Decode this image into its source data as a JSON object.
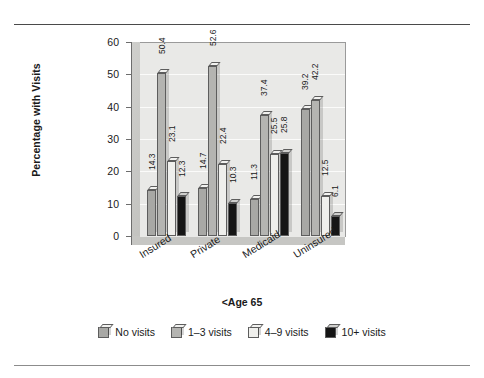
{
  "chart_data": {
    "type": "bar",
    "title": "",
    "xlabel": "<Age 65",
    "ylabel": "Percentage with Visits",
    "ylim": [
      0,
      60
    ],
    "yticks": [
      0,
      10,
      20,
      30,
      40,
      50,
      60
    ],
    "grid": true,
    "legend_position": "bottom",
    "categories": [
      "Insured",
      "Private",
      "Medicaid",
      "Uninsured"
    ],
    "series": [
      {
        "name": "No visits",
        "color": "#a8a8a5",
        "values": [
          14.3,
          14.7,
          11.3,
          39.2
        ]
      },
      {
        "name": "1–3 visits",
        "color": "#b4b4b1",
        "values": [
          50.4,
          52.6,
          37.4,
          42.2
        ]
      },
      {
        "name": "4–9 visits",
        "color": "#efefec",
        "values": [
          23.1,
          22.4,
          25.5,
          12.5
        ]
      },
      {
        "name": "10+ visits",
        "color": "#151515",
        "values": [
          12.3,
          10.3,
          25.8,
          6.1
        ]
      }
    ],
    "value_labels": [
      [
        "14.3",
        "50.4",
        "23.1",
        "12.3"
      ],
      [
        "14.7",
        "52.6",
        "22.4",
        "10.3"
      ],
      [
        "11.3",
        "37.4",
        "25.5",
        "25.8"
      ],
      [
        "39.2",
        "42.2",
        "12.5",
        "6.1"
      ]
    ]
  }
}
